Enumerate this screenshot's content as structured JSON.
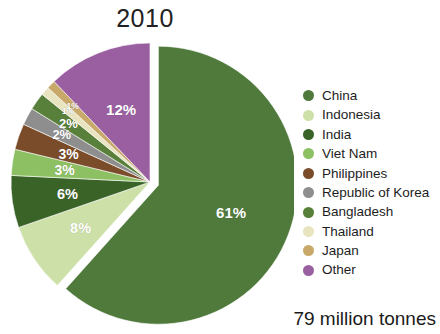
{
  "chart_data": {
    "type": "pie",
    "title": "2010",
    "total_label": "79 million tonnes",
    "xlabel": "",
    "ylabel": "",
    "legend_position": "right",
    "grid": false,
    "exploded_slice": "China",
    "categories": [
      "China",
      "Indonesia",
      "India",
      "Viet Nam",
      "Philippines",
      "Republic of Korea",
      "Bangladesh",
      "Thailand",
      "Japan",
      "Other"
    ],
    "values": [
      61,
      8,
      6,
      3,
      3,
      2,
      2,
      1,
      1,
      12
    ],
    "value_labels": [
      "61%",
      "8%",
      "6%",
      "3%",
      "3%",
      "2%",
      "2%",
      "1%",
      "1%",
      "12%"
    ],
    "colors": [
      "#4f7a3c",
      "#cde0a8",
      "#3a6328",
      "#8cc063",
      "#7a4c2a",
      "#8e8e8e",
      "#58803a",
      "#e8e4c0",
      "#c9a96a",
      "#9a5fa0"
    ],
    "slices": [
      {
        "name": "China",
        "value": 61,
        "label": "61%",
        "color": "#4f7a3c"
      },
      {
        "name": "Indonesia",
        "value": 8,
        "label": "8%",
        "color": "#cde0a8"
      },
      {
        "name": "India",
        "value": 6,
        "label": "6%",
        "color": "#3a6328"
      },
      {
        "name": "Viet Nam",
        "value": 3,
        "label": "3%",
        "color": "#8cc063"
      },
      {
        "name": "Philippines",
        "value": 3,
        "label": "3%",
        "color": "#7a4c2a"
      },
      {
        "name": "Republic of Korea",
        "value": 2,
        "label": "2%",
        "color": "#8e8e8e"
      },
      {
        "name": "Bangladesh",
        "value": 2,
        "label": "2%",
        "color": "#58803a"
      },
      {
        "name": "Thailand",
        "value": 1,
        "label": "1%",
        "color": "#e8e4c0"
      },
      {
        "name": "Japan",
        "value": 1,
        "label": "1%",
        "color": "#c9a96a"
      },
      {
        "name": "Other",
        "value": 12,
        "label": "12%",
        "color": "#9a5fa0"
      }
    ]
  },
  "legend": {
    "items": [
      {
        "label": "China",
        "color": "#4f7a3c"
      },
      {
        "label": "Indonesia",
        "color": "#cde0a8"
      },
      {
        "label": "India",
        "color": "#3a6328"
      },
      {
        "label": "Viet Nam",
        "color": "#8cc063"
      },
      {
        "label": "Philippines",
        "color": "#7a4c2a"
      },
      {
        "label": "Republic of Korea",
        "color": "#8e8e8e"
      },
      {
        "label": "Bangladesh",
        "color": "#58803a"
      },
      {
        "label": "Thailand",
        "color": "#e8e4c0"
      },
      {
        "label": "Japan",
        "color": "#c9a96a"
      },
      {
        "label": "Other",
        "color": "#9a5fa0"
      }
    ]
  }
}
